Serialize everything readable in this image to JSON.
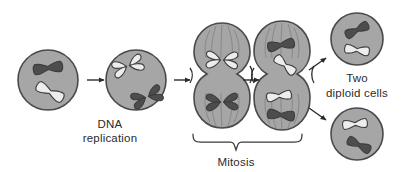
{
  "figure": {
    "type": "biology-process-diagram",
    "background_color": "#ffffff"
  },
  "palette": {
    "cell_fill": "#a6a6a6",
    "cell_fill_light": "#b3b3b3",
    "cell_outline": "#4a4a4a",
    "chromosome_dark": "#4d4d4d",
    "chromosome_light": "#ededed",
    "chromosome_outline": "#3d3d3d",
    "spindle_line": "#7d7d7d",
    "arrow_color": "#2b2b2b",
    "text_color": "#2b2b2b"
  },
  "labels": {
    "dna_replication": {
      "line1": "DNA",
      "line2": "replication"
    },
    "mitosis": "Mitosis",
    "two_diploid_cells": {
      "line1": "Two",
      "line2": "diploid cells"
    }
  },
  "stages": [
    {
      "id": "parent-cell",
      "name": "Parent diploid cell",
      "cx": 48,
      "cy": 80,
      "r": 30,
      "chromosomes": [
        {
          "id": "dark-chromosome",
          "shade": "dark",
          "form": "single",
          "x": 48,
          "y": 68,
          "angle": -8
        },
        {
          "id": "light-chromosome",
          "shade": "light",
          "form": "single",
          "x": 50,
          "y": 92,
          "angle": 28
        }
      ]
    },
    {
      "id": "replicated-cell",
      "name": "Cell after DNA replication",
      "cx": 136,
      "cy": 80,
      "r": 30,
      "chromosomes": [
        {
          "id": "light-replicated-chromosome",
          "shade": "light",
          "form": "duplicated",
          "x": 128,
          "y": 66,
          "angle": -20
        },
        {
          "id": "dark-replicated-chromosome",
          "shade": "dark",
          "form": "duplicated",
          "x": 146,
          "y": 97,
          "angle": -20
        }
      ]
    },
    {
      "id": "mitosis-anaphase-cell",
      "name": "Dividing cell, chromosomes aligned",
      "cx": 222,
      "cy": 80,
      "r": 28,
      "chromosomes": [
        {
          "id": "light-replicated-chromosome",
          "shade": "light",
          "form": "duplicated",
          "x": 222,
          "y": 58,
          "angle": 0
        },
        {
          "id": "dark-replicated-chromosome",
          "shade": "dark",
          "form": "duplicated",
          "x": 222,
          "y": 103,
          "angle": 0
        }
      ]
    },
    {
      "id": "mitosis-telophase-cell",
      "name": "Dividing cell, chromatids separated",
      "cx": 282,
      "cy": 80,
      "r": 28,
      "chromosomes": [
        {
          "id": "dark-chromosome",
          "shade": "dark",
          "form": "single",
          "x": 281,
          "y": 46,
          "angle": -10
        },
        {
          "id": "light-chromosome",
          "shade": "light",
          "form": "single",
          "x": 285,
          "y": 66,
          "angle": 38
        },
        {
          "id": "light-chromosome",
          "shade": "light",
          "form": "single",
          "x": 279,
          "y": 96,
          "angle": -8
        },
        {
          "id": "dark-chromosome",
          "shade": "dark",
          "form": "single",
          "x": 281,
          "y": 115,
          "angle": 6
        }
      ]
    },
    {
      "id": "daughter-cell-top",
      "name": "Top daughter diploid cell",
      "cx": 357,
      "cy": 39,
      "r": 26,
      "chromosomes": [
        {
          "id": "dark-chromosome",
          "shade": "dark",
          "form": "single",
          "x": 357,
          "y": 30,
          "angle": -26
        },
        {
          "id": "light-chromosome",
          "shade": "light",
          "form": "single",
          "x": 357,
          "y": 50,
          "angle": 8
        }
      ]
    },
    {
      "id": "daughter-cell-bottom",
      "name": "Bottom daughter diploid cell",
      "cx": 357,
      "cy": 134,
      "r": 26,
      "chromosomes": [
        {
          "id": "light-chromosome",
          "shade": "light",
          "form": "single",
          "x": 355,
          "y": 124,
          "angle": -6
        },
        {
          "id": "dark-chromosome",
          "shade": "dark",
          "form": "single",
          "x": 359,
          "y": 145,
          "angle": 26
        }
      ]
    }
  ],
  "arrows": [
    {
      "id": "arrow-replication",
      "from": "parent-cell",
      "to": "replicated-cell",
      "x1": 87,
      "y1": 80,
      "x2": 106,
      "y2": 80
    },
    {
      "id": "arrow-to-mitosis",
      "from": "replicated-cell",
      "to": "mitosis-anaphase-cell",
      "x1": 175,
      "y1": 80,
      "x2": 192,
      "y2": 80
    },
    {
      "id": "arrow-mitosis-progress",
      "from": "mitosis-anaphase-cell",
      "to": "mitosis-telophase-cell",
      "x1": 241,
      "y1": 80,
      "x2": 258,
      "y2": 80
    },
    {
      "id": "arrow-to-top-daughter",
      "from": "mitosis-telophase-cell",
      "to": "daughter-cell-top",
      "x1": 308,
      "y1": 68,
      "x2": 327,
      "y2": 56
    },
    {
      "id": "arrow-to-bottom-daughter",
      "from": "mitosis-telophase-cell",
      "to": "daughter-cell-bottom",
      "x1": 308,
      "y1": 110,
      "x2": 327,
      "y2": 122
    }
  ],
  "brace": {
    "id": "mitosis-brace",
    "label": "Mitosis",
    "left_x": 193,
    "right_x": 302,
    "y": 140,
    "tip_x": 236,
    "tip_y": 150
  },
  "text_positions": {
    "dna_replication_x": 110,
    "dna_replication_y1": 127,
    "dna_replication_y2": 141,
    "mitosis_x": 236,
    "mitosis_y": 165,
    "two_diploid_x": 357,
    "two_diploid_y1": 81,
    "two_diploid_y2": 96
  }
}
